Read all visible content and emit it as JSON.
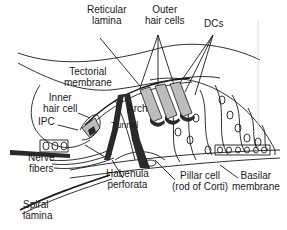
{
  "diagram": {
    "labels": {
      "reticular_lamina": "Reticular\nlamina",
      "outer_hair_cells": "Outer\nhair cells",
      "dcs": "DCs",
      "tectorial_membrane": "Tectorial\nmembrane",
      "inner_hair_cell": "Inner\nhair cell",
      "arch": "Arch",
      "ipc": "IPC",
      "tunnel": "Tunnel",
      "nerve_fibers": "Nerve\nfibers",
      "habenula_perforata": "Habenula\nperforata",
      "pillar_cell": "Pillar cell\n(rod of Corti)",
      "basilar_membrane": "Basilar\nmembrane",
      "spiral_lamina": "Spiral\nlamina"
    },
    "colors": {
      "line": "#1a1a1a",
      "shade": "#bdbdbd",
      "dark": "#2a2a2a",
      "background": "#ffffff"
    }
  }
}
